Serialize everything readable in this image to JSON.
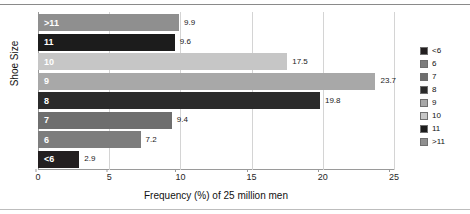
{
  "chart_data": {
    "type": "bar",
    "orientation": "horizontal",
    "title": "",
    "xlabel": "Frequency (%) of 25 million men",
    "ylabel": "Shoe Size",
    "categories": [
      "<6",
      "6",
      "7",
      "8",
      "9",
      "10",
      "11",
      ">11"
    ],
    "values": [
      2.9,
      7.2,
      9.4,
      19.8,
      23.7,
      17.5,
      9.6,
      9.9
    ],
    "bar_colors": [
      "#231f20",
      "#7d7d7d",
      "#6e6e6e",
      "#2b2b2b",
      "#a8a8a8",
      "#c6c6c6",
      "#1c1c1c",
      "#8f8f8f"
    ],
    "xlim": [
      0,
      25
    ],
    "xticks": [
      0,
      5,
      10,
      15,
      20,
      25
    ],
    "grid": true,
    "grid_axis": "x",
    "legend_position": "right",
    "legend": [
      {
        "label": "<6",
        "color": "#231f20"
      },
      {
        "label": "6",
        "color": "#7d7d7d"
      },
      {
        "label": "7",
        "color": "#6e6e6e"
      },
      {
        "label": "8",
        "color": "#2b2b2b"
      },
      {
        "label": "9",
        "color": "#a8a8a8"
      },
      {
        "label": "10",
        "color": "#c6c6c6"
      },
      {
        "label": "11",
        "color": "#1c1c1c"
      },
      {
        "label": ">11",
        "color": "#8f8f8f"
      }
    ]
  }
}
